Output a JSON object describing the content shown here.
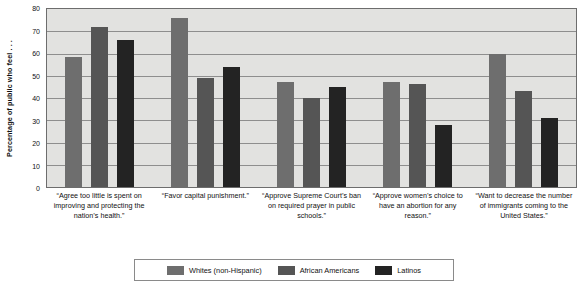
{
  "chart_data": {
    "type": "bar",
    "title": "",
    "xlabel": "",
    "ylabel": "Percentage of public who feel . . .",
    "ylim": [
      0,
      80
    ],
    "yticks": [
      0,
      10,
      20,
      30,
      40,
      50,
      60,
      70,
      80
    ],
    "ytick_labels": [
      "0",
      "10",
      "20",
      "30",
      "40",
      "50",
      "60",
      "70",
      "80"
    ],
    "grid": true,
    "legend_position": "bottom",
    "categories": [
      "“Agree too little is spent on improving and protecting the nation’s health.”",
      "“Favor capital punishment.”",
      "“Approve Supreme Court’s ban on required prayer in public schools.”",
      "“Approve women’s choice to have an abortion for any reason.”",
      "“Want to decrease the number of immigrants coming to the United States.”"
    ],
    "series": [
      {
        "name": "Whites (non-Hispanic)",
        "color": "#6e6e6e",
        "values": [
          58.5,
          76,
          47,
          47,
          60
        ]
      },
      {
        "name": "African Americans",
        "color": "#555555",
        "values": [
          72,
          49,
          40,
          46.5,
          43
        ]
      },
      {
        "name": "Latinos",
        "color": "#232323",
        "values": [
          66,
          54,
          45,
          28,
          31
        ]
      }
    ]
  },
  "colors": {
    "plot_background": "#e2e2e0",
    "plot_border": "#6d6d6d",
    "gridline": "#8e8e8e",
    "page_background": "#ffffff",
    "text": "#111111"
  }
}
